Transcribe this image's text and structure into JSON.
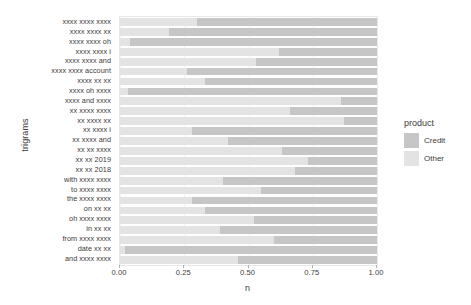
{
  "chart_data": {
    "type": "bar",
    "title": "",
    "subtitle": "",
    "orientation": "horizontal",
    "stacked": true,
    "normalized": true,
    "xlabel": "n",
    "ylabel": "trigrams",
    "xlim": [
      0.0,
      1.0
    ],
    "xticks": [
      "0.00",
      "0.25",
      "0.50",
      "0.75",
      "1.00"
    ],
    "xtick_values": [
      0.0,
      0.25,
      0.5,
      0.75,
      1.0
    ],
    "grid": true,
    "legend_position": "right",
    "legend_title": "product",
    "colors": {
      "Credit": "#c6c6c6",
      "Other": "#e3e3e3",
      "panel_background": "#ffffff",
      "gridline": "#f2f2f2",
      "text": "#3c3c3c"
    },
    "categories": [
      "xxxx xxxx xxxx",
      "xxxx xxxx xx",
      "xxxx xxxx oh",
      "xxxx xxxx i",
      "xxxx xxxx and",
      "xxxx xxxx account",
      "xxxx xx xx",
      "xxxx oh xxxx",
      "xxxx and xxxx",
      "xx xxxx xxxx",
      "xx xxxx xx",
      "xx xxxx i",
      "xx xxxx and",
      "xx xx xxxx",
      "xx xx 2019",
      "xx xx 2018",
      "with xxxx xxxx",
      "to xxxx xxxx",
      "the xxxx xxxx",
      "on xx xx",
      "oh xxxx xxxx",
      "in xx xx",
      "from xxxx xxxx",
      "date xx xx",
      "and xxxx xxxx"
    ],
    "series": [
      {
        "name": "Other",
        "values": [
          0.3,
          0.19,
          0.04,
          0.62,
          0.53,
          0.26,
          0.33,
          0.03,
          0.86,
          0.66,
          0.87,
          0.28,
          0.42,
          0.63,
          0.73,
          0.68,
          0.4,
          0.55,
          0.28,
          0.33,
          0.52,
          0.39,
          0.6,
          0.02,
          0.46
        ]
      },
      {
        "name": "Credit",
        "values": [
          0.7,
          0.81,
          0.96,
          0.38,
          0.47,
          0.74,
          0.67,
          0.97,
          0.14,
          0.34,
          0.13,
          0.72,
          0.58,
          0.37,
          0.27,
          0.32,
          0.6,
          0.45,
          0.72,
          0.67,
          0.48,
          0.61,
          0.4,
          0.98,
          0.54
        ]
      }
    ]
  },
  "legend": {
    "title": "product",
    "items": [
      {
        "label": "Credit",
        "color": "#c6c6c6"
      },
      {
        "label": "Other",
        "color": "#e3e3e3"
      }
    ]
  },
  "axes": {
    "x": {
      "label": "n",
      "ticks": [
        "0.00",
        "0.25",
        "0.50",
        "0.75",
        "1.00"
      ]
    },
    "y": {
      "label": "trigrams"
    }
  }
}
